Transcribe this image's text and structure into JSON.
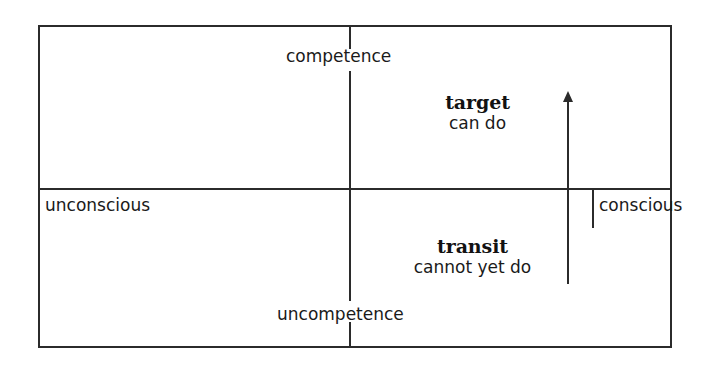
{
  "diagram": {
    "type": "2x2-matrix",
    "axes": {
      "vertical_top": "competence",
      "vertical_bottom": "uncompetence",
      "horizontal_left": "unconscious",
      "horizontal_right": "conscious"
    },
    "annotations": [
      {
        "id": "target",
        "title": "target",
        "subtitle": "can do",
        "quadrant": "conscious-competence"
      },
      {
        "id": "transit",
        "title": "transit",
        "subtitle": "cannot yet do",
        "quadrant": "conscious-uncompetence"
      }
    ],
    "arrow": {
      "name": "upward-arrow",
      "direction": "up",
      "meaning": "transit to target"
    },
    "colors": {
      "line": "#2b2b2b",
      "text": "#1a1a1a",
      "background": "#ffffff"
    }
  }
}
